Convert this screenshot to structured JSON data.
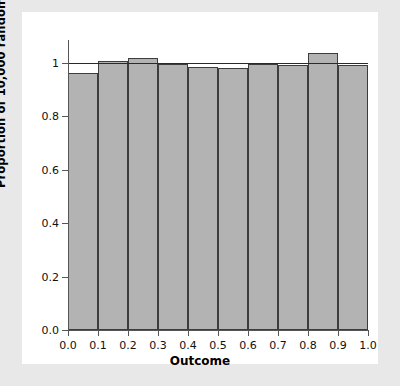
{
  "chart_data": {
    "type": "bar",
    "title": "",
    "subtitle": "",
    "xlabel": "Outcome",
    "ylabel": "Proportion of 10,000 random numbers",
    "categories": [
      "0.0-0.1",
      "0.1-0.2",
      "0.2-0.3",
      "0.3-0.4",
      "0.4-0.5",
      "0.5-0.6",
      "0.6-0.7",
      "0.7-0.8",
      "0.8-0.9",
      "0.9-1.0"
    ],
    "bin_edges": [
      0.0,
      0.1,
      0.2,
      0.3,
      0.4,
      0.5,
      0.6,
      0.7,
      0.8,
      0.9,
      1.0
    ],
    "values": [
      0.963,
      1.007,
      1.018,
      0.996,
      0.984,
      0.983,
      0.995,
      0.991,
      1.036,
      0.992
    ],
    "xlim": [
      0.0,
      1.0
    ],
    "ylim": [
      0.0,
      1.12
    ],
    "xticks": [
      "0.0",
      "0.1",
      "0.2",
      "0.3",
      "0.4",
      "0.5",
      "0.6",
      "0.7",
      "0.8",
      "0.9",
      "1.0"
    ],
    "xtick_values": [
      0.0,
      0.1,
      0.2,
      0.3,
      0.4,
      0.5,
      0.6,
      0.7,
      0.8,
      0.9,
      1.0
    ],
    "yticks": [
      "0.0",
      "0.2",
      "0.4",
      "0.6",
      "0.8",
      "1"
    ],
    "ytick_values": [
      0.0,
      0.2,
      0.4,
      0.6,
      0.8,
      1.0
    ],
    "grid": false,
    "legend": null,
    "reference_line": {
      "orientation": "horizontal",
      "value": 1.0,
      "color": "#2a2a2a"
    },
    "bar_fill_color": "#b3b3b3",
    "bar_edge_color": "#3d3d3d",
    "plot_background": "#ffffff",
    "figure_background": "#e8e8e8"
  }
}
